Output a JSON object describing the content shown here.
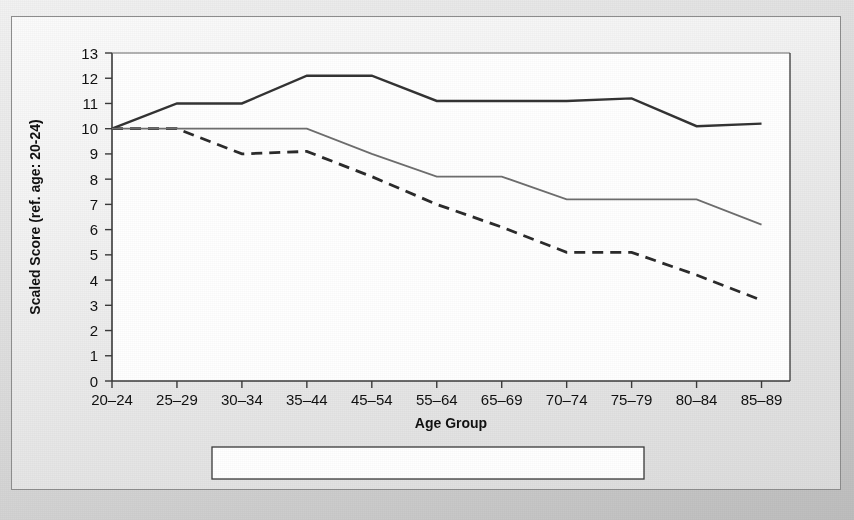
{
  "figure": {
    "frame_border_color": "#8d8d8d",
    "plot_background": "#ffffff"
  },
  "chart_data": {
    "type": "line",
    "title": "",
    "xlabel": "Age Group",
    "ylabel": "Scaled Score (ref. age: 20-24)",
    "categories": [
      "20–24",
      "25–29",
      "30–34",
      "35–44",
      "45–54",
      "55–64",
      "65–69",
      "70–74",
      "75–79",
      "80–84",
      "85–89"
    ],
    "ylim": [
      0,
      13
    ],
    "yticks": [
      0,
      1,
      2,
      3,
      4,
      5,
      6,
      7,
      8,
      9,
      10,
      11,
      12,
      13
    ],
    "ytick_labels": [
      "0",
      "1",
      "2",
      "3",
      "4",
      "5",
      "6",
      "7",
      "8",
      "9",
      "10",
      "11",
      "12",
      "13"
    ],
    "grid": false,
    "legend_position": "bottom",
    "series": [
      {
        "name": "Vocabulary",
        "style": "solid",
        "color": "#333333",
        "width": 2.4,
        "values": [
          10.0,
          11.0,
          11.0,
          12.1,
          12.1,
          11.1,
          11.1,
          11.1,
          11.2,
          10.1,
          10.2
        ]
      },
      {
        "name": "Digit Symbol",
        "style": "dashed",
        "color": "#2b2b2b",
        "width": 2.8,
        "values": [
          10.0,
          10.0,
          9.0,
          9.1,
          8.1,
          7.0,
          6.1,
          5.1,
          5.1,
          4.2,
          3.2
        ]
      },
      {
        "name": "Block Design",
        "style": "solid",
        "color": "#6e6e6e",
        "width": 1.8,
        "values": [
          10.0,
          10.0,
          10.0,
          10.0,
          9.0,
          8.1,
          8.1,
          7.2,
          7.2,
          7.2,
          6.2
        ]
      }
    ]
  },
  "legend": {
    "items": [
      {
        "label": "Vocabulary",
        "style": "solid",
        "color": "#333333"
      },
      {
        "label": "Digit Symbol",
        "style": "dashed",
        "color": "#2b2b2b"
      },
      {
        "label": "Block Design",
        "style": "solid",
        "color": "#6e6e6e"
      }
    ]
  }
}
